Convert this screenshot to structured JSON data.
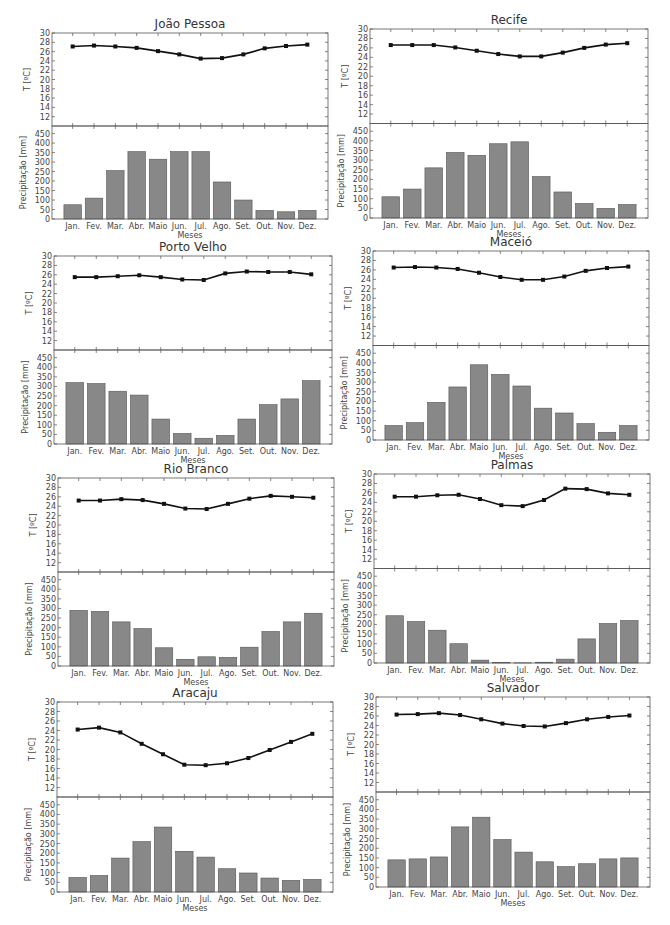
{
  "months": [
    "Jan.",
    "Fev.",
    "Mar.",
    "Abr.",
    "Maio",
    "Jun.",
    "Jul.",
    "Ago.",
    "Set.",
    "Out.",
    "Nov.",
    "Dez."
  ],
  "labels": {
    "xlabel": "Meses",
    "ylabel_temp": "T [ºC]",
    "ylabel_precip": "Precipitação [mm]",
    "temp_ticks": [
      12,
      14,
      16,
      18,
      20,
      22,
      24,
      26,
      28,
      30
    ],
    "precip_ticks": [
      0,
      50,
      100,
      150,
      200,
      250,
      300,
      350,
      400,
      450
    ]
  },
  "colors": {
    "bar": "#888888",
    "line": "#111111",
    "frame": "#555555"
  },
  "chart_data": [
    {
      "type": "bar+line",
      "title": "João Pessoa",
      "xlabel": "Meses",
      "ylabel": [
        "T [ºC]",
        "Precipitação [mm]"
      ],
      "temp_ylim": [
        10,
        30
      ],
      "precip_ylim": [
        0,
        490
      ],
      "categories": [
        "Jan.",
        "Fev.",
        "Mar.",
        "Abr.",
        "Maio",
        "Jun.",
        "Jul.",
        "Ago.",
        "Set.",
        "Out.",
        "Nov.",
        "Dez."
      ],
      "series": [
        {
          "name": "Temperatura",
          "type": "line",
          "values": [
            27.1,
            27.3,
            27.1,
            26.8,
            26.1,
            25.4,
            24.5,
            24.6,
            25.4,
            26.7,
            27.2,
            27.5
          ]
        },
        {
          "name": "Precipitação",
          "type": "bar",
          "values": [
            75,
            110,
            255,
            355,
            315,
            355,
            355,
            195,
            100,
            45,
            38,
            45
          ]
        }
      ]
    },
    {
      "type": "bar+line",
      "title": "Recife",
      "xlabel": "Meses",
      "ylabel": [
        "T [ºC]",
        "Precipitação [mm]"
      ],
      "temp_ylim": [
        10,
        30
      ],
      "precip_ylim": [
        0,
        490
      ],
      "categories": [
        "Jan.",
        "Fev.",
        "Mar.",
        "Abr.",
        "Maio",
        "Jun.",
        "Jul.",
        "Ago.",
        "Set.",
        "Out.",
        "Nov.",
        "Dez."
      ],
      "series": [
        {
          "name": "Temperatura",
          "type": "line",
          "values": [
            26.6,
            26.6,
            26.6,
            26.1,
            25.4,
            24.7,
            24.2,
            24.2,
            25.0,
            26.0,
            26.7,
            27.0
          ]
        },
        {
          "name": "Precipitação",
          "type": "bar",
          "values": [
            110,
            150,
            260,
            340,
            325,
            385,
            395,
            215,
            135,
            75,
            50,
            70
          ]
        }
      ]
    },
    {
      "type": "bar+line",
      "title": "Porto Velho",
      "xlabel": "Meses",
      "ylabel": [
        "T [ºC]",
        "Precipitação [mm]"
      ],
      "temp_ylim": [
        10,
        30
      ],
      "precip_ylim": [
        0,
        490
      ],
      "categories": [
        "Jan.",
        "Fev.",
        "Mar.",
        "Abr.",
        "Maio",
        "Jun.",
        "Jul.",
        "Ago.",
        "Set.",
        "Out.",
        "Nov.",
        "Dez."
      ],
      "series": [
        {
          "name": "Temperatura",
          "type": "line",
          "values": [
            25.5,
            25.5,
            25.7,
            25.9,
            25.5,
            25.0,
            24.9,
            26.3,
            26.7,
            26.6,
            26.6,
            26.1
          ]
        },
        {
          "name": "Precipitação",
          "type": "bar",
          "values": [
            320,
            315,
            275,
            255,
            130,
            55,
            30,
            45,
            130,
            205,
            235,
            330
          ]
        }
      ]
    },
    {
      "type": "bar+line",
      "title": "Maceió",
      "xlabel": "Meses",
      "ylabel": [
        "T [ºC]",
        "Precipitação [mm]"
      ],
      "temp_ylim": [
        10,
        30
      ],
      "precip_ylim": [
        0,
        490
      ],
      "categories": [
        "Jan.",
        "Fev.",
        "Mar.",
        "Abr.",
        "Maio",
        "Jun.",
        "Jul.",
        "Ago.",
        "Set.",
        "Out.",
        "Nov.",
        "Dez."
      ],
      "series": [
        {
          "name": "Temperatura",
          "type": "line",
          "values": [
            26.5,
            26.6,
            26.5,
            26.2,
            25.4,
            24.5,
            23.9,
            23.9,
            24.6,
            25.8,
            26.4,
            26.7
          ]
        },
        {
          "name": "Precipitação",
          "type": "bar",
          "values": [
            75,
            90,
            195,
            275,
            390,
            340,
            280,
            165,
            140,
            85,
            40,
            75
          ]
        }
      ]
    },
    {
      "type": "bar+line",
      "title": "Rio Branco",
      "xlabel": "Meses",
      "ylabel": [
        "T [ºC]",
        "Precipitação [mm]"
      ],
      "temp_ylim": [
        10,
        30
      ],
      "precip_ylim": [
        0,
        490
      ],
      "categories": [
        "Jan.",
        "Fev.",
        "Mar.",
        "Abr.",
        "Maio",
        "Jun.",
        "Jul.",
        "Ago.",
        "Set.",
        "Out.",
        "Nov.",
        "Dez."
      ],
      "series": [
        {
          "name": "Temperatura",
          "type": "line",
          "values": [
            25.2,
            25.2,
            25.5,
            25.3,
            24.5,
            23.5,
            23.4,
            24.5,
            25.6,
            26.2,
            26.0,
            25.8
          ]
        },
        {
          "name": "Precipitação",
          "type": "bar",
          "values": [
            290,
            285,
            230,
            195,
            95,
            35,
            48,
            45,
            98,
            180,
            230,
            275
          ]
        }
      ]
    },
    {
      "type": "bar+line",
      "title": "Palmas",
      "xlabel": "Meses",
      "ylabel": [
        "T [ºC]",
        "Precipitação [mm]"
      ],
      "temp_ylim": [
        10,
        30
      ],
      "precip_ylim": [
        0,
        490
      ],
      "categories": [
        "Jan.",
        "Fev.",
        "Mar.",
        "Abr.",
        "Maio",
        "Jun.",
        "Jul.",
        "Ago.",
        "Set.",
        "Out.",
        "Nov.",
        "Dez."
      ],
      "series": [
        {
          "name": "Temperatura",
          "type": "line",
          "values": [
            25.2,
            25.2,
            25.5,
            25.6,
            24.7,
            23.4,
            23.2,
            24.5,
            26.9,
            26.8,
            25.9,
            25.6
          ]
        },
        {
          "name": "Precipitação",
          "type": "bar",
          "values": [
            245,
            215,
            170,
            100,
            15,
            3,
            1,
            4,
            20,
            125,
            205,
            220
          ]
        }
      ]
    },
    {
      "type": "bar+line",
      "title": "Aracaju",
      "xlabel": "Meses",
      "ylabel": [
        "T [ºC]",
        "Precipitação [mm]"
      ],
      "temp_ylim": [
        10,
        30
      ],
      "precip_ylim": [
        0,
        490
      ],
      "categories": [
        "Jan.",
        "Fev.",
        "Mar.",
        "Abr.",
        "Maio",
        "Jun.",
        "Jul.",
        "Ago.",
        "Set.",
        "Out.",
        "Nov.",
        "Dez."
      ],
      "series": [
        {
          "name": "Temperatura",
          "type": "line",
          "values": [
            24.2,
            24.6,
            23.6,
            21.2,
            19.0,
            16.8,
            16.7,
            17.1,
            18.2,
            19.9,
            21.6,
            23.3
          ]
        },
        {
          "name": "Precipitação",
          "type": "bar",
          "values": [
            75,
            85,
            175,
            260,
            335,
            210,
            180,
            120,
            98,
            72,
            60,
            65
          ]
        }
      ]
    },
    {
      "type": "bar+line",
      "title": "Salvador",
      "xlabel": "Meses",
      "ylabel": [
        "T [ºC]",
        "Precipitação [mm]"
      ],
      "temp_ylim": [
        10,
        30
      ],
      "precip_ylim": [
        0,
        490
      ],
      "categories": [
        "Jan.",
        "Fev.",
        "Mar.",
        "Abr.",
        "Maio",
        "Jun.",
        "Jul.",
        "Ago.",
        "Set.",
        "Out.",
        "Nov.",
        "Dez."
      ],
      "series": [
        {
          "name": "Temperatura",
          "type": "line",
          "values": [
            26.3,
            26.4,
            26.6,
            26.2,
            25.3,
            24.4,
            23.9,
            23.8,
            24.5,
            25.3,
            25.8,
            26.1
          ]
        },
        {
          "name": "Precipitação",
          "type": "bar",
          "values": [
            140,
            145,
            155,
            310,
            360,
            245,
            180,
            130,
            105,
            120,
            145,
            150
          ]
        }
      ]
    }
  ],
  "layout": [
    {
      "left": 52,
      "top": 33,
      "width": 276,
      "height": 186
    },
    {
      "left": 370,
      "top": 29,
      "width": 278,
      "height": 189
    },
    {
      "left": 54,
      "top": 256,
      "width": 278,
      "height": 188
    },
    {
      "left": 373,
      "top": 251,
      "width": 276,
      "height": 189
    },
    {
      "left": 58,
      "top": 478,
      "width": 276,
      "height": 188
    },
    {
      "left": 374,
      "top": 474,
      "width": 276,
      "height": 189
    },
    {
      "left": 57,
      "top": 702,
      "width": 276,
      "height": 190
    },
    {
      "left": 376,
      "top": 697,
      "width": 274,
      "height": 190
    }
  ]
}
